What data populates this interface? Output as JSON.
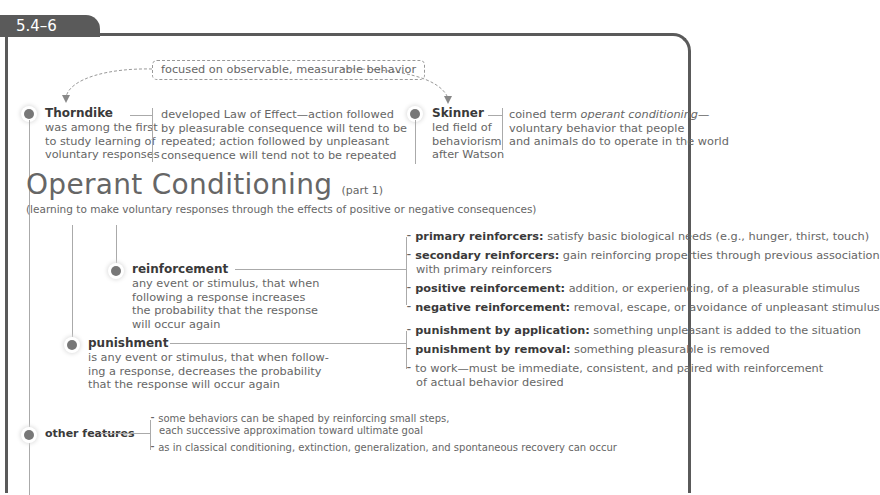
{
  "section_tab": "5.4–6",
  "top_note": "focused on observable, measurable behavior",
  "thorndike": {
    "name": "Thorndike",
    "desc": [
      "was among the first",
      "to study learning of",
      "voluntary responses"
    ],
    "detail": [
      "developed Law of Effect—action followed",
      "by pleasurable consequence will tend to be",
      "repeated; action followed by unpleasant",
      "consequence will tend not to be repeated"
    ]
  },
  "skinner": {
    "name": "Skinner",
    "desc": [
      "led field of",
      "behaviorism",
      "after Watson"
    ],
    "detail_prefix": "coined term ",
    "detail_italic": "operant conditioning",
    "detail_suffix": "—",
    "detail_rest": [
      "voluntary behavior that people",
      "and animals do to operate in the world"
    ]
  },
  "title": {
    "main": "Operant Conditioning",
    "part": "(part 1)",
    "subtitle": "(learning to make voluntary responses through the effects of positive or negative consequences)"
  },
  "reinforcement": {
    "name": "reinforcement",
    "desc": [
      "any event or stimulus, that when",
      "following a response increases",
      "the probability that the response",
      "will occur again"
    ],
    "items": [
      {
        "term": "primary reinforcers:",
        "text": " satisfy basic biological needs (e.g., hunger, thirst, touch)",
        "cont": ""
      },
      {
        "term": "secondary reinforcers:",
        "text": " gain reinforcing properties through previous association",
        "cont": "with primary reinforcers"
      },
      {
        "term": "positive reinforcement:",
        "text": " addition, or experiencing, of a pleasurable stimulus",
        "cont": ""
      },
      {
        "term": "negative reinforcement:",
        "text": " removal, escape, or avoidance of unpleasant stimulus",
        "cont": ""
      }
    ]
  },
  "punishment": {
    "name": "punishment",
    "desc": [
      "is any event or stimulus, that when follow-",
      "ing a response, decreases the probability",
      "that the response will occur again"
    ],
    "items": [
      {
        "term": "punishment by application:",
        "text": " something unpleasant is added to the situation",
        "cont": ""
      },
      {
        "term": "punishment by removal:",
        "text": " something pleasurable is removed",
        "cont": ""
      },
      {
        "term": "",
        "text": "to work—must be immediate, consistent, and paired with reinforcement",
        "cont": "of actual behavior desired"
      }
    ]
  },
  "other": {
    "name": "other features",
    "items": [
      {
        "text": "some behaviors can be shaped by reinforcing small steps,",
        "cont": "each successive approximation toward ultimate goal"
      },
      {
        "text": "as in classical conditioning, extinction, generalization, and spontaneous recovery can occur",
        "cont": ""
      }
    ]
  }
}
